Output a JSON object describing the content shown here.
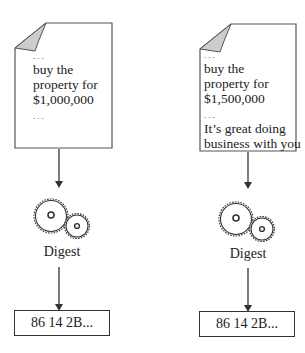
{
  "diagram": {
    "left": {
      "document_lines": [
        "...",
        "buy the",
        "property for",
        "$1,000,000",
        "..."
      ],
      "process_label": "Digest",
      "hash_output": "86 14 2B..."
    },
    "right": {
      "document_lines": [
        "...",
        "buy the",
        "property for",
        "$1,500,000",
        "...",
        "It’s great doing",
        "business with you"
      ],
      "process_label": "Digest",
      "hash_output": "86 14 2B..."
    }
  }
}
